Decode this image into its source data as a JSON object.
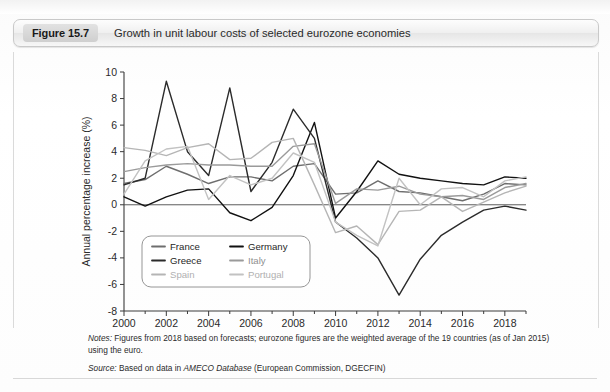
{
  "figure": {
    "tag": "Figure 15.7",
    "title": "Growth in unit labour costs of selected eurozone economies"
  },
  "notes": {
    "notes_label": "Notes:",
    "notes_text": " Figures from 2018 based on forecasts; eurozone figures are the weighted average of the 19 countries (as of Jan 2015) using the euro.",
    "source_label": "Source:",
    "source_pre": " Based on data in ",
    "source_italic": "AMECO Database",
    "source_post": " (European Commission, DGECFIN)"
  },
  "chart_data": {
    "type": "line",
    "title": "Growth in unit labour costs of selected eurozone economies",
    "xlabel": "",
    "ylabel": "Annual percentage increase (%)",
    "xlim": [
      2000,
      2019
    ],
    "ylim": [
      -8,
      10
    ],
    "ytick_values": [
      10,
      8,
      6,
      4,
      2,
      0,
      -2,
      -4,
      -6,
      -8
    ],
    "ytick_labels": [
      "10",
      "8",
      "6",
      "4",
      "2",
      "0",
      "-2",
      "-4",
      "-6",
      "-8"
    ],
    "xtick_values": [
      2000,
      2002,
      2004,
      2006,
      2008,
      2010,
      2012,
      2014,
      2016,
      2018
    ],
    "xtick_labels": [
      "2000",
      "2002",
      "2004",
      "2006",
      "2008",
      "2010",
      "2012",
      "2014",
      "2016",
      "2018"
    ],
    "x_minor_step": 1,
    "grid": false,
    "zero_line": true,
    "legend_position": "lower-left-inside",
    "x": [
      2000,
      2001,
      2002,
      2003,
      2004,
      2005,
      2006,
      2007,
      2008,
      2009,
      2010,
      2011,
      2012,
      2013,
      2014,
      2015,
      2016,
      2017,
      2018,
      2019
    ],
    "series": [
      {
        "name": "France",
        "color": "#6e6e6e",
        "values": [
          1.6,
          1.9,
          2.9,
          2.3,
          1.6,
          2.1,
          2.1,
          1.8,
          2.9,
          3.1,
          0.8,
          0.9,
          1.8,
          1.0,
          0.9,
          0.6,
          0.3,
          0.8,
          1.6,
          1.5
        ]
      },
      {
        "name": "Germany",
        "color": "#111111",
        "values": [
          0.6,
          -0.1,
          0.6,
          1.1,
          1.2,
          -0.6,
          -1.2,
          -0.2,
          2.2,
          6.2,
          -1.0,
          1.0,
          3.3,
          2.3,
          2.0,
          1.8,
          1.6,
          1.5,
          2.1,
          2.0
        ]
      },
      {
        "name": "Greece",
        "color": "#2b2b2b",
        "values": [
          1.5,
          2.0,
          9.3,
          4.0,
          2.2,
          8.8,
          1.0,
          3.2,
          7.2,
          5.0,
          -1.3,
          -2.5,
          -4.0,
          -6.8,
          -4.1,
          -2.3,
          -1.3,
          -0.4,
          -0.1,
          -0.4
        ]
      },
      {
        "name": "Italy",
        "color": "#9a9a9a",
        "values": [
          2.5,
          2.8,
          3.0,
          3.1,
          3.0,
          3.0,
          2.9,
          2.9,
          4.4,
          4.6,
          0.1,
          1.2,
          1.1,
          1.4,
          0.8,
          0.6,
          0.7,
          0.4,
          1.3,
          1.6
        ]
      },
      {
        "name": "Spain",
        "color": "#b5b5b5",
        "values": [
          4.3,
          4.1,
          3.7,
          4.3,
          4.6,
          3.4,
          3.5,
          4.7,
          5.0,
          1.5,
          -2.1,
          -1.6,
          -3.0,
          -0.5,
          -0.4,
          0.6,
          -0.5,
          0.2,
          0.9,
          1.4
        ]
      },
      {
        "name": "Portugal",
        "color": "#c2c2c2",
        "values": [
          0.8,
          3.3,
          4.2,
          4.4,
          0.4,
          2.2,
          1.5,
          2.0,
          3.9,
          3.2,
          -1.3,
          -2.3,
          -3.1,
          2.0,
          0.0,
          1.2,
          1.3,
          0.6,
          1.8,
          2.1
        ]
      }
    ],
    "legend_rows": [
      [
        "France",
        "Germany"
      ],
      [
        "Greece",
        "Italy"
      ],
      [
        "Spain",
        "Portugal"
      ]
    ]
  }
}
